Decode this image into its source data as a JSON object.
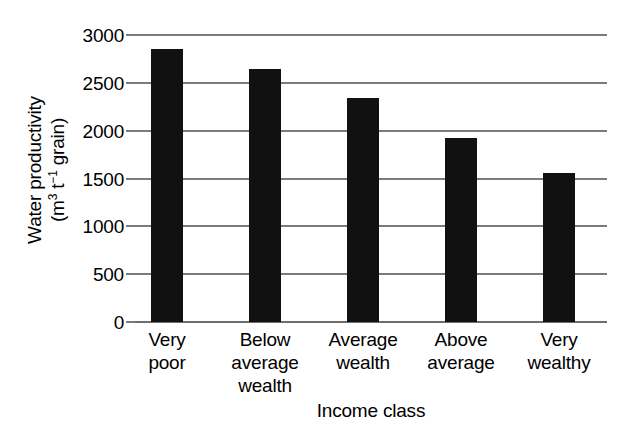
{
  "chart_data": {
    "type": "bar",
    "title": "",
    "categories": [
      "Very poor",
      "Below average wealth",
      "Average wealth",
      "Above average",
      "Very wealthy"
    ],
    "category_lines": [
      [
        "Very",
        "poor"
      ],
      [
        "Below",
        "average",
        "wealth"
      ],
      [
        "Average",
        "wealth"
      ],
      [
        "Above",
        "average"
      ],
      [
        "Very",
        "wealthy"
      ]
    ],
    "values": [
      2850,
      2640,
      2340,
      1920,
      1560
    ],
    "xlabel": "Income class",
    "ylabel": "Water productivity (m3 t-1 grain)",
    "ylabel_line1": "Water productivity",
    "ylabel_line2_prefix": "(m",
    "ylabel_line2_sup1": "3",
    "ylabel_line2_mid": " t",
    "ylabel_line2_sup2": "−1",
    "ylabel_line2_suffix": " grain)",
    "ylim": [
      0,
      3000
    ],
    "yticks": [
      0,
      500,
      1000,
      1500,
      2000,
      2500,
      3000
    ],
    "ytick_labels": [
      "0",
      "500",
      "1000",
      "1500",
      "2000",
      "2500",
      "3000"
    ],
    "grid": true,
    "legend": "none",
    "bar_color": "#111111",
    "grid_color": "#7b7b7b",
    "background_color": "#ffffff"
  }
}
